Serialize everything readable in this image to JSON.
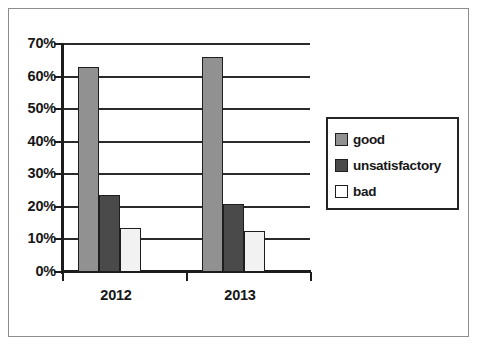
{
  "chart_data": {
    "type": "bar",
    "title": "",
    "xlabel": "",
    "ylabel": "",
    "categories": [
      "2012",
      "2013"
    ],
    "series": [
      {
        "name": "good",
        "values": [
          63,
          66
        ],
        "color": "#919191"
      },
      {
        "name": "unsatisfactory",
        "values": [
          23.5,
          21
        ],
        "color": "#4a4a4a"
      },
      {
        "name": "bad",
        "values": [
          13.5,
          12.5
        ],
        "color": "#f2f2f2"
      }
    ],
    "ylim": [
      0,
      70
    ],
    "ytick_labels": [
      "70%",
      "60%",
      "50%",
      "40%",
      "30%",
      "20%",
      "10%",
      "0%"
    ],
    "ytick_values": [
      70,
      60,
      50,
      40,
      30,
      20,
      10,
      0
    ],
    "grid": true,
    "legend_position": "right"
  },
  "legend": {
    "items": [
      {
        "label": "good"
      },
      {
        "label": "unsatisfactory"
      },
      {
        "label": "bad"
      }
    ]
  }
}
